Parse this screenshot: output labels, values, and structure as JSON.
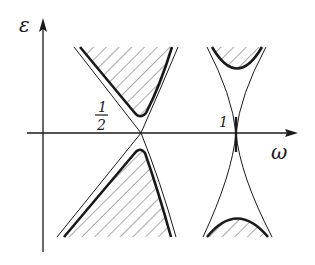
{
  "diagram": {
    "axes": {
      "x_label": "ω",
      "y_label": "ε"
    },
    "ticks": {
      "half_numerator": "1",
      "half_denominator": "2",
      "one": "1"
    },
    "colors": {
      "ink": "#1a1a1a",
      "hatch": "#555555",
      "background": "#ffffff"
    },
    "regions": [
      {
        "name": "left-upper-shaded",
        "description": "hatched region above ω=1/2 crossing"
      },
      {
        "name": "left-lower-shaded",
        "description": "hatched region below ω=1/2 crossing"
      },
      {
        "name": "right-upper-shaded",
        "description": "hatched cap above ω=1 cusp"
      },
      {
        "name": "right-lower-shaded",
        "description": "hatched cap below ω=1 cusp"
      }
    ]
  }
}
